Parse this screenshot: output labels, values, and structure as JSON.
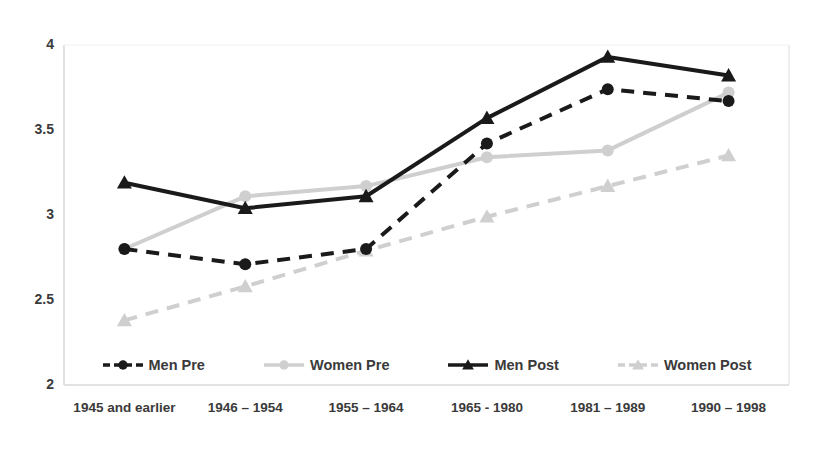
{
  "chart_data": {
    "type": "line",
    "title": "",
    "xlabel": "",
    "ylabel": "",
    "categories": [
      "1945 and earlier",
      "1946 – 1954",
      "1955 – 1964",
      "1965 - 1980",
      "1981 – 1989",
      "1990 – 1998"
    ],
    "ylim": [
      2,
      4
    ],
    "yticks": [
      "2",
      "2.5",
      "3",
      "3.5",
      "4"
    ],
    "ytick_values": [
      2,
      2.5,
      3,
      3.5,
      4
    ],
    "grid": false,
    "legend_position": "bottom",
    "series": [
      {
        "name": "Men Pre",
        "values": [
          2.8,
          2.71,
          2.8,
          3.42,
          3.74,
          3.67
        ],
        "color": "#1a1a1a",
        "line_style": "dashed",
        "marker": "circle"
      },
      {
        "name": "Women Pre",
        "values": [
          2.8,
          3.11,
          3.17,
          3.34,
          3.38,
          3.72
        ],
        "color": "#cfcfcf",
        "line_style": "solid",
        "marker": "circle"
      },
      {
        "name": "Men Post",
        "values": [
          3.19,
          3.04,
          3.11,
          3.57,
          3.93,
          3.82
        ],
        "color": "#1a1a1a",
        "line_style": "solid",
        "marker": "triangle"
      },
      {
        "name": "Women Post",
        "values": [
          2.38,
          2.58,
          2.79,
          2.99,
          3.17,
          3.35
        ],
        "color": "#cfcfcf",
        "line_style": "dashed",
        "marker": "triangle"
      }
    ]
  },
  "axis": {
    "line_color": "#d9d9d9",
    "label_color": "#3a3a3a"
  }
}
